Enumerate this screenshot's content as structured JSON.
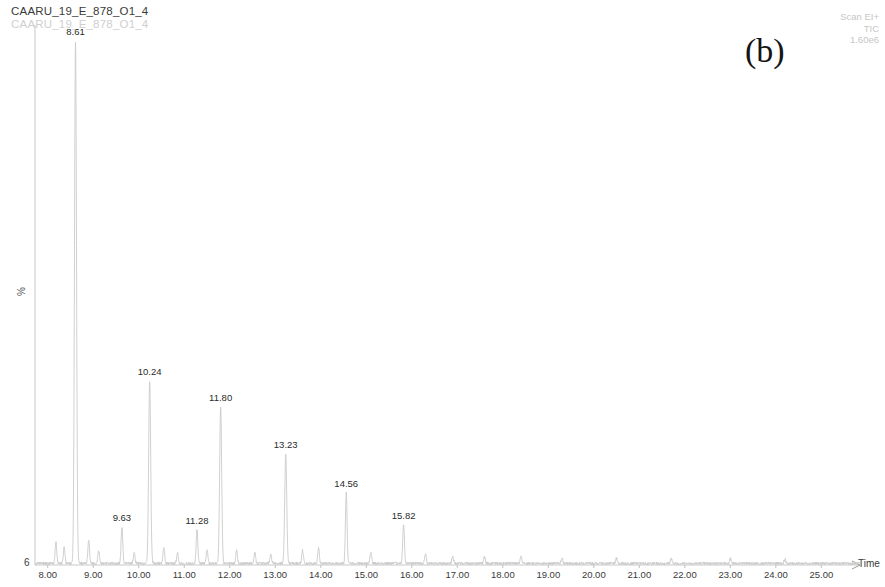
{
  "header": {
    "sample_name": "CAARU_19_E_878_O1_4",
    "sample_name_ghost": "CAARU_19_E_878_O1_4"
  },
  "acquisition": {
    "scan_mode": "Scan EI+",
    "trace": "TIC",
    "intensity": "1.60e6"
  },
  "panel": {
    "label": "(b)"
  },
  "axes": {
    "y_label": "%",
    "y_origin": "6",
    "x_title": "Time"
  },
  "chart_data": {
    "type": "line",
    "title": "CAARU_19_E_878_O1_4",
    "subtitle": "Scan EI+ TIC 1.60e6",
    "xlabel": "Time",
    "ylabel": "%",
    "xlim": [
      7.72,
      25.85
    ],
    "ylim": [
      0,
      100
    ],
    "grid": false,
    "legend": null,
    "x_ticks": [
      "8.00",
      "9.00",
      "10.00",
      "11.00",
      "12.00",
      "13.00",
      "14.00",
      "15.00",
      "16.00",
      "17.00",
      "18.00",
      "19.00",
      "20.00",
      "21.00",
      "22.00",
      "23.00",
      "24.00",
      "25.00"
    ],
    "x_tick_values": [
      8,
      9,
      10,
      11,
      12,
      13,
      14,
      15,
      16,
      17,
      18,
      19,
      20,
      21,
      22,
      23,
      24,
      25
    ],
    "peaks": [
      {
        "rt": "8.61",
        "x": 8.61,
        "height_pct": 100.0,
        "labelled": true
      },
      {
        "rt": "9.63",
        "x": 9.63,
        "height_pct": 7.0,
        "labelled": true
      },
      {
        "rt": "10.24",
        "x": 10.24,
        "height_pct": 35.0,
        "labelled": true
      },
      {
        "rt": "11.28",
        "x": 11.28,
        "height_pct": 6.5,
        "labelled": true
      },
      {
        "rt": "11.80",
        "x": 11.8,
        "height_pct": 30.0,
        "labelled": true
      },
      {
        "rt": "13.23",
        "x": 13.23,
        "height_pct": 21.0,
        "labelled": true
      },
      {
        "rt": "14.56",
        "x": 14.56,
        "height_pct": 13.5,
        "labelled": true
      },
      {
        "rt": "15.82",
        "x": 15.82,
        "height_pct": 7.5,
        "labelled": true
      }
    ],
    "minor_peaks": [
      {
        "x": 8.18,
        "height_pct": 4.0
      },
      {
        "x": 8.36,
        "height_pct": 3.0
      },
      {
        "x": 8.9,
        "height_pct": 4.5
      },
      {
        "x": 9.12,
        "height_pct": 2.5
      },
      {
        "x": 9.9,
        "height_pct": 2.0
      },
      {
        "x": 10.55,
        "height_pct": 3.0
      },
      {
        "x": 10.85,
        "height_pct": 2.0
      },
      {
        "x": 11.5,
        "height_pct": 2.5
      },
      {
        "x": 12.15,
        "height_pct": 2.5
      },
      {
        "x": 12.55,
        "height_pct": 2.0
      },
      {
        "x": 12.9,
        "height_pct": 1.8
      },
      {
        "x": 13.6,
        "height_pct": 2.5
      },
      {
        "x": 13.95,
        "height_pct": 3.0
      },
      {
        "x": 15.1,
        "height_pct": 2.0
      },
      {
        "x": 16.3,
        "height_pct": 1.8
      },
      {
        "x": 16.9,
        "height_pct": 1.5
      },
      {
        "x": 17.6,
        "height_pct": 1.2
      },
      {
        "x": 18.4,
        "height_pct": 1.2
      },
      {
        "x": 19.3,
        "height_pct": 1.0
      },
      {
        "x": 20.5,
        "height_pct": 1.0
      },
      {
        "x": 21.7,
        "height_pct": 0.9
      },
      {
        "x": 23.0,
        "height_pct": 0.9
      },
      {
        "x": 24.2,
        "height_pct": 0.8
      }
    ],
    "baseline_noise_pct": 0.6,
    "trace_color": "#c8c8c8",
    "axis_color": "#c0c0c0"
  }
}
